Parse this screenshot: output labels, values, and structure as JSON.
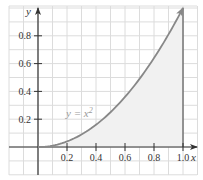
{
  "chart_data": {
    "type": "area",
    "title": "",
    "xlabel": "x",
    "ylabel": "y",
    "xlim": [
      -0.2,
      1.1
    ],
    "ylim": [
      -0.2,
      1.0
    ],
    "grid": true,
    "x_ticks": [
      0.2,
      0.4,
      0.6,
      0.8,
      1.0
    ],
    "x_tick_labels": [
      "0.2",
      "0.4",
      "0.6",
      "0.8",
      "1.0"
    ],
    "y_ticks": [
      0.2,
      0.4,
      0.6,
      0.8
    ],
    "y_tick_labels": [
      "0.2",
      "0.4",
      "0.6",
      "0.8"
    ],
    "series": [
      {
        "name": "y = x²",
        "function": "x^2",
        "x": [
          0,
          0.1,
          0.2,
          0.3,
          0.4,
          0.5,
          0.6,
          0.7,
          0.8,
          0.9,
          1.0
        ],
        "values": [
          0,
          0.01,
          0.04,
          0.09,
          0.16,
          0.25,
          0.36,
          0.49,
          0.64,
          0.81,
          1.0
        ],
        "shaded_region": {
          "from": 0,
          "to": 1.0
        }
      }
    ],
    "annotations": [
      {
        "text": "y = x²",
        "x": 0.35,
        "y": 0.24
      }
    ],
    "vertical_line": {
      "x": 1.0
    }
  },
  "labels": {
    "x_axis": "x",
    "y_axis": "y",
    "curve": "y = x²",
    "x_ticks": [
      "0.2",
      "0.4",
      "0.6",
      "0.8",
      "1.0"
    ],
    "y_ticks": [
      "0.2",
      "0.4",
      "0.6",
      "0.8"
    ]
  },
  "colors": {
    "curve": "#888888",
    "shade": "#f1f1f1",
    "grid": "#dcdcdc",
    "axis": "#333333"
  }
}
